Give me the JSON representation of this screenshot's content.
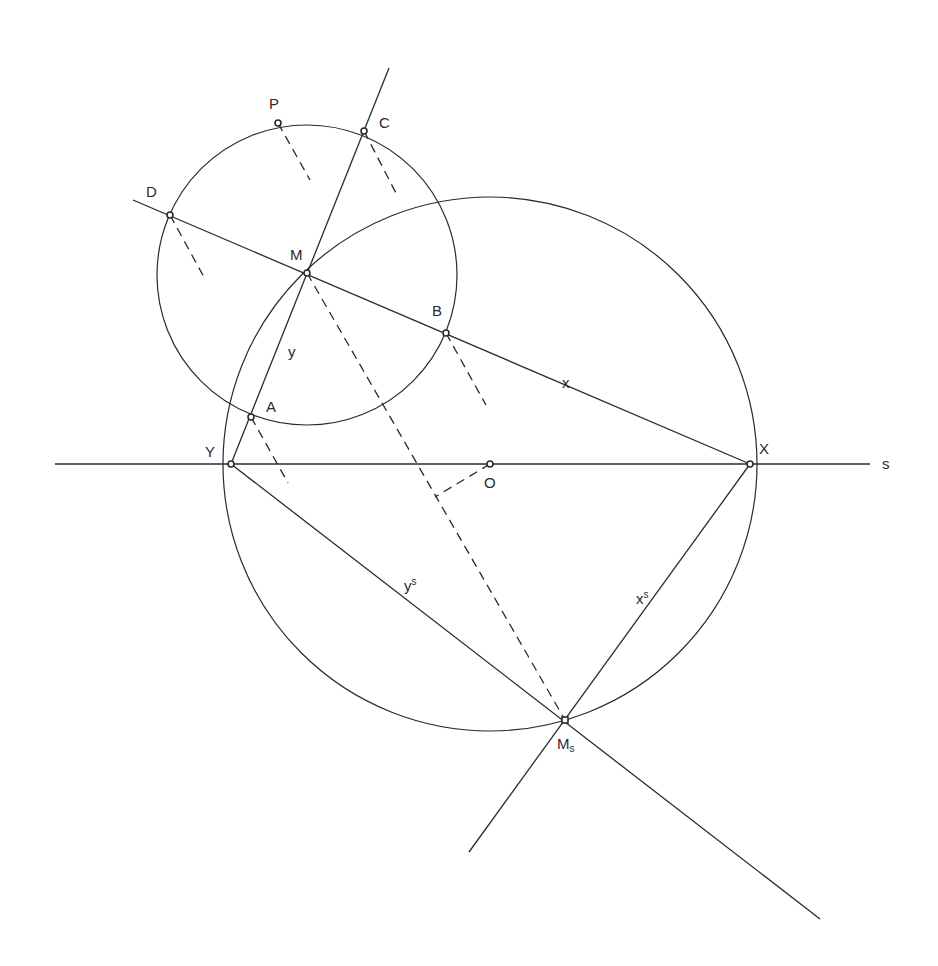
{
  "diagram": {
    "labels": {
      "P": "P",
      "C": "C",
      "D": "D",
      "M": "M",
      "B": "B",
      "y": "y",
      "x": "x",
      "A": "A",
      "Y": "Y",
      "O": "O",
      "X": "X",
      "s": "s",
      "ys_base": "y",
      "ys_sup": "s",
      "xs_base": "x",
      "xs_sup": "s",
      "Ms_base": "M",
      "Ms_sub": "s"
    },
    "points": {
      "P": [
        278,
        123
      ],
      "C": [
        364,
        131
      ],
      "D": [
        170,
        215
      ],
      "M": [
        307,
        273
      ],
      "B": [
        446,
        333
      ],
      "A": [
        251,
        417
      ],
      "Y": [
        231,
        464
      ],
      "O": [
        490,
        464
      ],
      "X": [
        750,
        464
      ],
      "Ms": [
        565,
        720
      ]
    },
    "circles": [
      {
        "name": "circle-centered-M",
        "cx": 307,
        "cy": 275,
        "r": 150
      },
      {
        "name": "thales-circle-centered-O",
        "cx": 490,
        "cy": 464,
        "r": 267
      }
    ],
    "stroke_color": "#2a2a2a",
    "background": "#ffffff"
  }
}
